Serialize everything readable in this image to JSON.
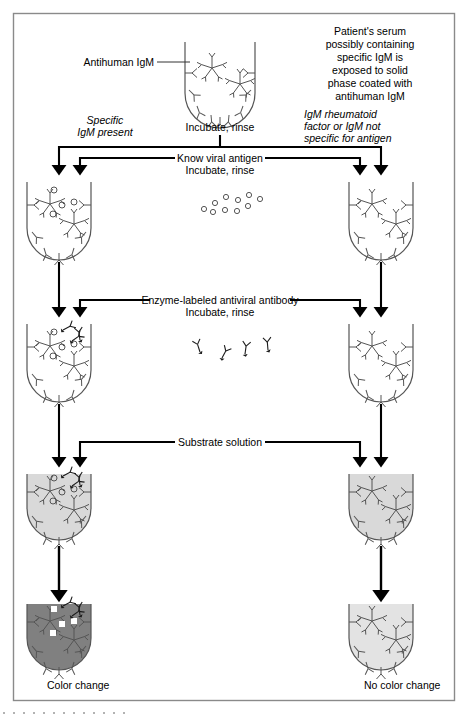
{
  "figure": {
    "border_color": "#8a8a8a",
    "ink_color": "#000000",
    "well_outline_color": "#555555",
    "colors": {
      "substrate_fill": "#d9d9d9",
      "positive_fill": "#808080",
      "negative_fill": "#e3e3e3",
      "antigen_dot": "#ffffff"
    }
  },
  "labels": {
    "antihuman_igm": "Antihuman IgM",
    "patient_serum": "Patient's serum\npossibly containing\nspecific IgM is\nexposed to solid\nphase coated with\nantihuman IgM",
    "patient_serum_lines": [
      "Patient's serum",
      "possibly containing",
      "specific IgM is",
      "exposed to solid",
      "phase coated with",
      "antihuman IgM"
    ],
    "incubate_rinse_top": "Incubate, rinse",
    "specific_igm_present_lines": [
      "Specific",
      "IgM present"
    ],
    "rheumatoid_lines": [
      "IgM rheumatoid",
      "factor or IgM not",
      "specific for antigen"
    ],
    "step_antigen_lines": [
      "Know viral antigen",
      "Incubate, rinse"
    ],
    "step_enzyme_lines": [
      "Enzyme-labeled antiviral antibody",
      "Incubate, rinse"
    ],
    "step_substrate": "Substrate solution",
    "result_positive": "Color change",
    "result_negative": "No color change"
  },
  "flow": {
    "branches": [
      {
        "id": "positive",
        "label": "Specific IgM present",
        "result": "Color change"
      },
      {
        "id": "negative",
        "label": "IgM rheumatoid factor or IgM not specific for antigen",
        "result": "No color change"
      }
    ],
    "steps": [
      {
        "index": 1,
        "reagent": "Patient's serum",
        "action": "Incubate, rinse"
      },
      {
        "index": 2,
        "reagent": "Know viral antigen",
        "action": "Incubate, rinse"
      },
      {
        "index": 3,
        "reagent": "Enzyme-labeled antiviral antibody",
        "action": "Incubate, rinse"
      },
      {
        "index": 4,
        "reagent": "Substrate solution",
        "action": ""
      }
    ]
  },
  "legend_symbols": [
    {
      "name": "y-antibody",
      "meaning": "Antihuman IgM capture antibody (solid phase coating)"
    },
    {
      "name": "star-igm",
      "meaning": "IgM pentamer from patient serum"
    },
    {
      "name": "open-circle",
      "meaning": "Known viral antigen"
    },
    {
      "name": "enzyme-labeled-antibody",
      "meaning": "Enzyme-labeled antiviral antibody"
    },
    {
      "name": "white-square",
      "meaning": "Colored reaction product"
    }
  ]
}
